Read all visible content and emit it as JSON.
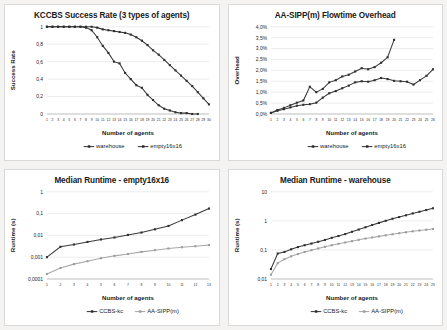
{
  "figure": {
    "background": "#f4f3f1",
    "panel_background": "#ffffff",
    "series_colors": {
      "dark": "#3a3a3a",
      "light": "#a8a8a8"
    }
  },
  "panels": [
    {
      "id": "kccbs-success-rate",
      "title": "KCCBS Success Rate (3 types of agents)",
      "xlabel": "Number of agents",
      "ylabel": "Success Rate",
      "legend": [
        "warehouse",
        "empty16x16"
      ]
    },
    {
      "id": "aa-sipp-flowtime-overhead",
      "title": "AA-SIPP(m) Flowtime Overhead",
      "xlabel": "Number of agents",
      "ylabel": "Overhead",
      "legend": [
        "warehouse",
        "empty16x16"
      ]
    },
    {
      "id": "median-runtime-empty16x16",
      "title": "Median Runtime - empty16x16",
      "xlabel": "Number of agents",
      "ylabel": "Runtime (s)",
      "legend": [
        "CCBS-kc",
        "AA-SIPP(m)"
      ]
    },
    {
      "id": "median-runtime-warehouse",
      "title": "Median Runtime - warehouse",
      "xlabel": "Number of agents",
      "ylabel": "Runtime (s)",
      "legend": [
        "CCBS-kc",
        "AA-SIPP(m)"
      ]
    }
  ],
  "chart_data": [
    {
      "type": "line",
      "title": "KCCBS Success Rate (3 types of agents)",
      "xlabel": "Number of agents",
      "ylabel": "Success Rate",
      "legend_position": "bottom",
      "grid": true,
      "xlim": [
        1,
        30
      ],
      "ylim": [
        0,
        1
      ],
      "yticks": [
        0,
        0.2,
        0.4,
        0.6,
        0.8,
        1
      ],
      "ytick_labels": [
        "0",
        "0,2",
        "0,4",
        "0,6",
        "0,8",
        "1"
      ],
      "x": [
        1,
        2,
        3,
        4,
        5,
        6,
        7,
        8,
        9,
        10,
        11,
        12,
        13,
        14,
        15,
        16,
        17,
        18,
        19,
        20,
        21,
        22,
        23,
        24,
        25,
        26,
        27,
        28,
        29,
        30
      ],
      "xtick_labels": [
        "1",
        "2",
        "3",
        "4",
        "5",
        "6",
        "7",
        "8",
        "9",
        "10",
        "11",
        "12",
        "13",
        "14",
        "15",
        "16",
        "17",
        "18",
        "19",
        "20",
        "21",
        "22",
        "23",
        "24",
        "25",
        "26",
        "27",
        "28",
        "29",
        "30"
      ],
      "series": [
        {
          "name": "warehouse",
          "color": "#3a3a3a",
          "values": [
            1,
            1,
            1,
            1,
            1,
            1,
            1,
            1,
            1,
            0.99,
            0.97,
            0.96,
            0.95,
            0.94,
            0.93,
            0.91,
            0.88,
            0.84,
            0.79,
            0.73,
            0.68,
            0.62,
            0.56,
            0.5,
            0.44,
            0.38,
            0.32,
            0.25,
            0.18,
            0.11
          ]
        },
        {
          "name": "empty16x16",
          "color": "#3a3a3a",
          "values": [
            1,
            1,
            1,
            1,
            1,
            1,
            1,
            0.99,
            0.96,
            0.88,
            0.78,
            0.7,
            0.6,
            0.58,
            0.47,
            0.4,
            0.33,
            0.3,
            0.22,
            0.16,
            0.1,
            0.06,
            0.04,
            0.02,
            0.01,
            0.01,
            0.0,
            0.0,
            null,
            null
          ]
        }
      ]
    },
    {
      "type": "line",
      "title": "AA-SIPP(m) Flowtime Overhead",
      "xlabel": "Number of agents",
      "ylabel": "Overhead",
      "legend_position": "bottom",
      "grid": true,
      "xlim": [
        1,
        26
      ],
      "ylim": [
        0,
        4
      ],
      "yticks": [
        0,
        0.5,
        1.0,
        1.5,
        2.0,
        2.5,
        3.0,
        3.5,
        4.0
      ],
      "ytick_labels": [
        "0,0%",
        "0,5%",
        "1,0%",
        "1,5%",
        "2,0%",
        "2,5%",
        "3,0%",
        "3,5%",
        "4,0%"
      ],
      "y_unit": "%",
      "x": [
        1,
        2,
        3,
        4,
        5,
        6,
        7,
        8,
        9,
        10,
        11,
        12,
        13,
        14,
        15,
        16,
        17,
        18,
        19,
        20,
        21,
        22,
        23,
        24,
        25,
        26
      ],
      "xtick_labels": [
        "1",
        "2",
        "3",
        "4",
        "5",
        "6",
        "7",
        "8",
        "9",
        "10",
        "11",
        "12",
        "13",
        "14",
        "15",
        "16",
        "17",
        "18",
        "19",
        "20",
        "21",
        "22",
        "23",
        "24",
        "25",
        "26"
      ],
      "series": [
        {
          "name": "warehouse",
          "color": "#3a3a3a",
          "values": [
            0.05,
            0.15,
            0.22,
            0.3,
            0.38,
            0.42,
            0.45,
            0.52,
            0.75,
            0.95,
            1.05,
            1.18,
            1.3,
            1.45,
            1.5,
            1.48,
            1.55,
            1.65,
            1.6,
            1.52,
            1.5,
            1.48,
            1.35,
            1.55,
            1.75,
            2.05,
            2.15
          ]
        },
        {
          "name": "empty16x16",
          "color": "#3a3a3a",
          "values": [
            0.05,
            0.18,
            0.28,
            0.4,
            0.52,
            0.62,
            1.25,
            1.0,
            1.15,
            1.45,
            1.55,
            1.72,
            1.8,
            1.95,
            2.1,
            2.05,
            2.15,
            2.35,
            2.6,
            3.4,
            null,
            null,
            null,
            null,
            null,
            null
          ]
        }
      ]
    },
    {
      "type": "line",
      "title": "Median Runtime - empty16x16",
      "xlabel": "Number of agents",
      "ylabel": "Runtime (s)",
      "legend_position": "bottom",
      "grid": true,
      "y_scale": "log",
      "xlim": [
        1,
        13
      ],
      "ylim": [
        0.0001,
        1
      ],
      "yticks": [
        0.0001,
        0.001,
        0.01,
        0.1,
        1
      ],
      "ytick_labels": [
        "0,0001",
        "0,001",
        "0,01",
        "0,1",
        "1"
      ],
      "x": [
        1,
        2,
        3,
        4,
        5,
        6,
        7,
        8,
        9,
        10,
        11,
        12,
        13
      ],
      "xtick_labels": [
        "1",
        "2",
        "3",
        "4",
        "5",
        "6",
        "7",
        "8",
        "9",
        "10",
        "11",
        "12",
        "13"
      ],
      "series": [
        {
          "name": "CCBS-kc",
          "color": "#3a3a3a",
          "values": [
            0.001,
            0.003,
            0.0038,
            0.005,
            0.0065,
            0.008,
            0.0105,
            0.0135,
            0.019,
            0.027,
            0.05,
            0.09,
            0.17
          ]
        },
        {
          "name": "AA-SIPP(m)",
          "color": "#a8a8a8",
          "values": [
            0.00017,
            0.00032,
            0.00048,
            0.00065,
            0.0009,
            0.00115,
            0.0014,
            0.00175,
            0.0021,
            0.0025,
            0.00285,
            0.0032,
            0.0036
          ]
        }
      ]
    },
    {
      "type": "line",
      "title": "Median Runtime - warehouse",
      "xlabel": "Number of agents",
      "ylabel": "Runtime (s)",
      "legend_position": "bottom",
      "grid": true,
      "y_scale": "log",
      "xlim": [
        1,
        25
      ],
      "ylim": [
        0.01,
        10
      ],
      "yticks": [
        0.01,
        0.1,
        1,
        10
      ],
      "ytick_labels": [
        "0,01",
        "0,1",
        "1",
        "10"
      ],
      "x": [
        1,
        2,
        3,
        4,
        5,
        6,
        7,
        8,
        9,
        10,
        11,
        12,
        13,
        14,
        15,
        16,
        17,
        18,
        19,
        20,
        21,
        22,
        23,
        24,
        25
      ],
      "xtick_labels": [
        "1",
        "2",
        "3",
        "4",
        "5",
        "6",
        "7",
        "8",
        "9",
        "10",
        "11",
        "12",
        "13",
        "14",
        "15",
        "16",
        "17",
        "18",
        "19",
        "20",
        "21",
        "22",
        "23",
        "24",
        "25"
      ],
      "series": [
        {
          "name": "CCBS-kc",
          "color": "#3a3a3a",
          "values": [
            0.022,
            0.075,
            0.085,
            0.105,
            0.125,
            0.145,
            0.165,
            0.19,
            0.22,
            0.26,
            0.3,
            0.35,
            0.42,
            0.5,
            0.6,
            0.72,
            0.85,
            1.0,
            1.18,
            1.35,
            1.55,
            1.8,
            2.05,
            2.35,
            2.7
          ]
        },
        {
          "name": "AA-SIPP(m)",
          "color": "#a8a8a8",
          "values": [
            0.014,
            0.035,
            0.048,
            0.06,
            0.072,
            0.085,
            0.098,
            0.112,
            0.128,
            0.145,
            0.162,
            0.18,
            0.2,
            0.222,
            0.245,
            0.268,
            0.292,
            0.318,
            0.345,
            0.375,
            0.405,
            0.435,
            0.465,
            0.495,
            0.525
          ]
        }
      ]
    }
  ]
}
